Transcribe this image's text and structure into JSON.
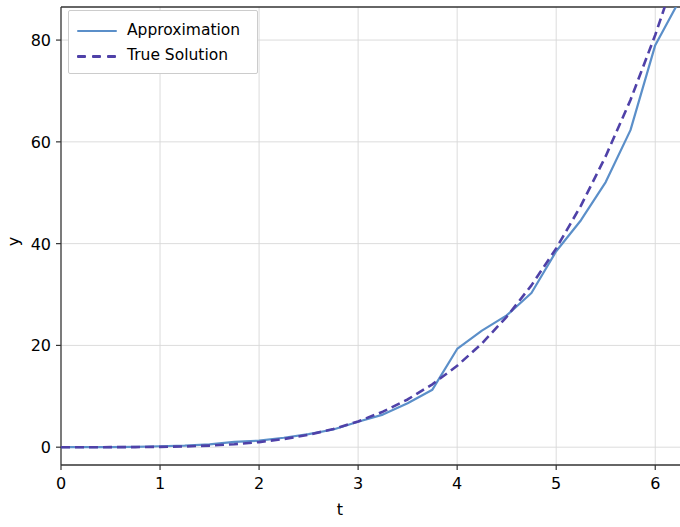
{
  "chart_data": {
    "type": "line",
    "title": "",
    "xlabel": "t",
    "ylabel": "y",
    "xlim": [
      0,
      6.25
    ],
    "ylim": [
      -3.5,
      86.5
    ],
    "xticks": [
      0,
      1,
      2,
      3,
      4,
      5,
      6
    ],
    "xtick_labels": [
      "0",
      "1",
      "2",
      "3",
      "4",
      "5",
      "6"
    ],
    "yticks": [
      0,
      20,
      40,
      60,
      80
    ],
    "ytick_labels": [
      "0",
      "20",
      "40",
      "60",
      "80"
    ],
    "grid": true,
    "grid_color": "#d8d8d8",
    "legend_position": "upper left",
    "x": [
      0,
      0.25,
      0.5,
      0.75,
      1,
      1.25,
      1.5,
      1.75,
      2,
      2.25,
      2.5,
      2.75,
      3,
      3.25,
      3.5,
      3.75,
      4,
      4.25,
      4.5,
      4.75,
      5,
      5.25,
      5.5,
      5.75,
      6,
      6.25
    ],
    "series": [
      {
        "name": "Approximation",
        "color": "#5b8fc9",
        "style": "solid",
        "values": [
          0.0,
          0.0,
          0.01,
          0.08,
          0.18,
          0.3,
          0.56,
          1.03,
          1.28,
          1.85,
          2.57,
          3.47,
          5.0,
          6.41,
          8.65,
          11.3,
          19.3,
          22.9,
          25.9,
          30.3,
          38.5,
          44.6,
          52.1,
          62.3,
          79.0,
          88.0
        ],
        "approx_function": "y = t^4 / 16 (numerical approximation, slightly below true solution)"
      },
      {
        "name": "True Solution",
        "color": "#4f41a8",
        "style": "dashed",
        "values": [
          0.0,
          0.0,
          0.0039,
          0.0198,
          0.0625,
          0.1526,
          0.3164,
          0.5861,
          1.0,
          1.6016,
          2.4414,
          3.5745,
          5.0625,
          6.9751,
          9.3789,
          12.3596,
          16.0,
          20.3795,
          25.6289,
          31.8027,
          39.0625,
          47.4785,
          57.1914,
          68.2295,
          81.0,
          95.4
        ]
      }
    ]
  },
  "legend": {
    "items": [
      {
        "label": "Approximation",
        "color": "#5b8fc9",
        "style": "solid"
      },
      {
        "label": "True Solution",
        "color": "#4f41a8",
        "style": "dashed"
      }
    ]
  },
  "axes": {
    "xlabel": "t",
    "ylabel": "y",
    "xtick_labels": [
      "0",
      "1",
      "2",
      "3",
      "4",
      "5",
      "6"
    ],
    "ytick_labels": [
      "0",
      "20",
      "40",
      "60",
      "80"
    ]
  },
  "colors": {
    "approximation": "#5b8fc9",
    "true_solution": "#4f41a8",
    "grid": "#d8d8d8",
    "spine": "#333333",
    "background": "#ffffff"
  }
}
